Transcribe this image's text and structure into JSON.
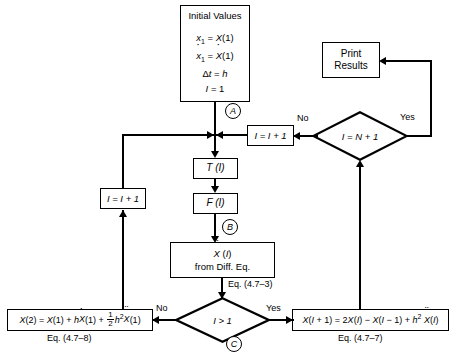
{
  "diagram": {
    "nodes": {
      "initial_values": {
        "heading": "Initial Values",
        "lines": [
          "x₁ = X(1)",
          "ẋ₁ = Ẋ(1)",
          "Δt = h",
          "I = 1"
        ]
      },
      "print_results": {
        "line1": "Print",
        "line2": "Results"
      },
      "increment_right": {
        "label": "I = I + 1"
      },
      "increment_left": {
        "label": "I = I + 1"
      },
      "t_of_i": {
        "label": "T (I)"
      },
      "f_of_i": {
        "label": "F (I)"
      },
      "accel": {
        "line1": "Ẍ (I)",
        "line2": "from Diff. Eq."
      },
      "eq_left": {
        "label": "X(2) = X(1) + hẊ(1) + ½ h² Ẍ(1)"
      },
      "eq_right": {
        "label": "X(I + 1) = 2X(I) − X(I − 1) + h² Ẍ(I)"
      }
    },
    "decisions": {
      "loop_test": {
        "label": "I = N + 1",
        "no": "No",
        "yes": "Yes"
      },
      "first_step_test": {
        "label": "I > 1",
        "no": "No",
        "yes": "Yes"
      }
    },
    "connectors": {
      "a": "A",
      "b": "B",
      "c": "C"
    },
    "equation_refs": {
      "accel_ref": "Eq. (4.7–3)",
      "left_ref": "Eq. (4.7–8)",
      "right_ref": "Eq. (4.7–7)"
    },
    "colors": {
      "stroke": "#000000",
      "background": "#ffffff"
    }
  }
}
